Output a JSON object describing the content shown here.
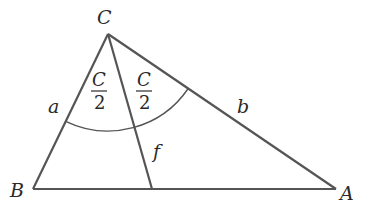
{
  "diagram": {
    "type": "triangle-angle-bisector",
    "stroke_color": "#555555",
    "text_color": "#2a2a2a",
    "vertices": {
      "C": {
        "label": "C",
        "x": 108,
        "y": 34
      },
      "B": {
        "label": "B",
        "x": 33,
        "y": 189
      },
      "A": {
        "label": "A",
        "x": 336,
        "y": 189
      }
    },
    "bisector_foot": {
      "x": 152,
      "y": 189
    },
    "sides": {
      "a": {
        "label": "a",
        "between": [
          "C",
          "B"
        ]
      },
      "b": {
        "label": "b",
        "between": [
          "C",
          "A"
        ]
      },
      "f": {
        "label": "f",
        "between": [
          "C",
          "bisector_foot"
        ]
      }
    },
    "angle_labels": {
      "left_half": {
        "numerator": "C",
        "denominator": "2"
      },
      "right_half": {
        "numerator": "C",
        "denominator": "2"
      }
    },
    "arc_radius": 97
  }
}
